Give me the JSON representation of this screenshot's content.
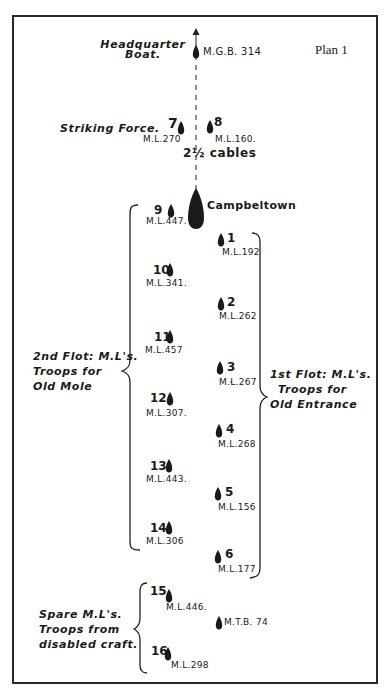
{
  "plan_label": "Plan 1",
  "headquarter": {
    "label_line1": "Headquarter",
    "label_line2": "Boat.",
    "ship": "M.G.B. 314"
  },
  "striking_force": {
    "label": "Striking Force.",
    "ships": [
      {
        "number": "7",
        "code": "M.L.270"
      },
      {
        "number": "8",
        "code": "M.L.160."
      }
    ],
    "spacing": "2½ cables"
  },
  "campbeltown": {
    "label": "Campbeltown"
  },
  "second_flotilla": {
    "label_line1": "2nd Flot: M.L's.",
    "label_line2": "Troops for",
    "label_line3": "Old Mole",
    "ships": [
      {
        "number": "9",
        "code": "M.L.447."
      },
      {
        "number": "10",
        "code": "M.L.341."
      },
      {
        "number": "11",
        "code": "M.L.457"
      },
      {
        "number": "12",
        "code": "M.L.307."
      },
      {
        "number": "13",
        "code": "M.L.443."
      },
      {
        "number": "14",
        "code": "M.L.306"
      }
    ]
  },
  "first_flotilla": {
    "label_line1": "1st Flot: M.L's.",
    "label_line2": "Troops for",
    "label_line3": "Old Entrance",
    "ships": [
      {
        "number": "1",
        "code": "M.L.192"
      },
      {
        "number": "2",
        "code": "M.L.262"
      },
      {
        "number": "3",
        "code": "M.L.267"
      },
      {
        "number": "4",
        "code": "M.L.268"
      },
      {
        "number": "5",
        "code": "M.L.156"
      },
      {
        "number": "6",
        "code": "M.L.177"
      }
    ]
  },
  "spare": {
    "label_line1": "Spare M.L's.",
    "label_line2": "Troops from",
    "label_line3": "disabled craft.",
    "ships": [
      {
        "number": "15",
        "code": "M.L.446."
      },
      {
        "number": "16",
        "code": "M.L.298"
      }
    ],
    "mtb": "M.T.B. 74"
  },
  "colors": {
    "ink": "#1a1a1a",
    "paper": "#ffffff"
  }
}
